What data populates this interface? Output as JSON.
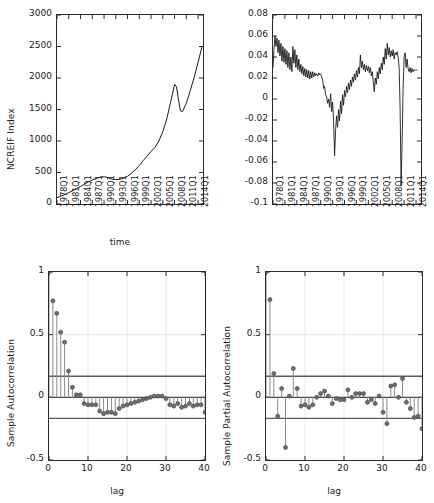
{
  "figure": {
    "width": 434,
    "height": 503,
    "background": "#ffffff",
    "line_color": "#1a1a1a",
    "axis_color": "#2b2b2b",
    "marker_color": "#6e6e6e",
    "bound_color": "#5a5a5a"
  },
  "chart_data": [
    {
      "id": "ncreif-index-series",
      "type": "line",
      "title": "",
      "xlabel": "time",
      "ylabel": "NCREIF Index",
      "ylim": [
        0,
        3000
      ],
      "yticks": [
        0,
        500,
        1000,
        1500,
        2000,
        2500,
        3000
      ],
      "ytick_labels": [
        "0",
        "500",
        "1000",
        "1500",
        "2000",
        "2500",
        "3000"
      ],
      "xlim": [
        1978,
        2015.25
      ],
      "xticks": [
        1978,
        1981,
        1984,
        1987,
        1990,
        1993,
        1996,
        1999,
        2002,
        2005,
        2008,
        2011,
        2014
      ],
      "xtick_labels": [
        "1978Q1",
        "1981Q1",
        "1984Q1",
        "1987Q1",
        "1990Q1",
        "1993Q1",
        "1996Q1",
        "1999Q1",
        "2002Q1",
        "2005Q1",
        "2008Q1",
        "2011Q1",
        "2014Q1"
      ],
      "grid": false,
      "x": [
        1978.0,
        1979.0,
        1980.0,
        1981.0,
        1982.0,
        1983.0,
        1984.0,
        1985.0,
        1986.0,
        1987.0,
        1988.0,
        1989.0,
        1990.0,
        1990.75,
        1991.5,
        1992.25,
        1993.0,
        1993.75,
        1994.5,
        1995.25,
        1996.0,
        1997.0,
        1998.0,
        1999.0,
        2000.0,
        2001.0,
        2002.0,
        2003.0,
        2004.0,
        2005.0,
        2006.0,
        2007.0,
        2008.0,
        2008.5,
        2009.0,
        2009.5,
        2010.0,
        2011.0,
        2012.0,
        2013.0,
        2014.0,
        2015.0
      ],
      "y": [
        100,
        125,
        150,
        180,
        210,
        245,
        280,
        315,
        350,
        380,
        405,
        425,
        432,
        425,
        405,
        392,
        388,
        392,
        400,
        415,
        440,
        490,
        545,
        610,
        690,
        760,
        835,
        900,
        1000,
        1150,
        1350,
        1620,
        1900,
        1860,
        1650,
        1480,
        1465,
        1600,
        1800,
        2010,
        2250,
        2500
      ]
    },
    {
      "id": "ncreif-returns-series",
      "type": "line",
      "title": "",
      "xlabel": "",
      "ylabel": "",
      "ylim": [
        -0.1,
        0.08
      ],
      "yticks": [
        -0.1,
        -0.08,
        -0.06,
        -0.04,
        -0.02,
        0,
        0.02,
        0.04,
        0.06,
        0.08
      ],
      "ytick_labels": [
        "-0.1",
        "-0.08",
        "-0.06",
        "-0.04",
        "-0.02",
        "0",
        "0.02",
        "0.04",
        "0.06",
        "0.08"
      ],
      "xlim": [
        1978,
        2015.25
      ],
      "xticks": [
        1978,
        1981,
        1984,
        1987,
        1990,
        1993,
        1996,
        1999,
        2002,
        2005,
        2008,
        2011,
        2014
      ],
      "xtick_labels": [
        "1978Q1",
        "1981Q1",
        "1984Q1",
        "1987Q1",
        "1990Q1",
        "1993Q1",
        "1996Q1",
        "1999Q1",
        "2002Q1",
        "2005Q1",
        "2008Q1",
        "2011Q1",
        "2014Q1"
      ],
      "grid": false,
      "x": [
        1978.0,
        1978.25,
        1978.5,
        1978.75,
        1979.0,
        1979.25,
        1979.5,
        1979.75,
        1980.0,
        1980.25,
        1980.5,
        1980.75,
        1981.0,
        1981.25,
        1981.5,
        1981.75,
        1982.0,
        1982.25,
        1982.5,
        1982.75,
        1983.0,
        1983.25,
        1983.5,
        1983.75,
        1984.0,
        1984.25,
        1984.5,
        1984.75,
        1985.0,
        1985.25,
        1985.5,
        1985.75,
        1986.0,
        1986.25,
        1986.5,
        1986.75,
        1987.0,
        1987.25,
        1987.5,
        1987.75,
        1988.0,
        1988.25,
        1988.5,
        1988.75,
        1989.0,
        1989.25,
        1989.5,
        1989.75,
        1990.0,
        1990.25,
        1990.5,
        1990.75,
        1991.0,
        1991.25,
        1991.5,
        1991.75,
        1992.0,
        1992.25,
        1992.5,
        1992.75,
        1993.0,
        1993.25,
        1993.5,
        1993.75,
        1994.0,
        1994.25,
        1994.5,
        1994.75,
        1995.0,
        1995.25,
        1995.5,
        1995.75,
        1996.0,
        1996.25,
        1996.5,
        1996.75,
        1997.0,
        1997.25,
        1997.5,
        1997.75,
        1998.0,
        1998.25,
        1998.5,
        1998.75,
        1999.0,
        1999.25,
        1999.5,
        1999.75,
        2000.0,
        2000.25,
        2000.5,
        2000.75,
        2001.0,
        2001.25,
        2001.5,
        2001.75,
        2002.0,
        2002.25,
        2002.5,
        2002.75,
        2003.0,
        2003.25,
        2003.5,
        2003.75,
        2004.0,
        2004.25,
        2004.5,
        2004.75,
        2005.0,
        2005.25,
        2005.5,
        2005.75,
        2006.0,
        2006.25,
        2006.5,
        2006.75,
        2007.0,
        2007.25,
        2007.5,
        2007.75,
        2008.0,
        2008.25,
        2008.5,
        2008.75,
        2009.0,
        2009.25,
        2009.5,
        2009.75,
        2010.0,
        2010.25,
        2010.5,
        2010.75,
        2011.0,
        2011.25,
        2011.5,
        2011.75,
        2012.0,
        2012.25,
        2012.5,
        2012.75,
        2013.0,
        2013.25,
        2013.5,
        2013.75,
        2014.0,
        2014.25,
        2014.5,
        2014.75,
        2015.0
      ],
      "y": [
        0.03,
        0.047,
        0.06,
        0.05,
        0.058,
        0.044,
        0.056,
        0.041,
        0.053,
        0.036,
        0.05,
        0.035,
        0.048,
        0.033,
        0.046,
        0.03,
        0.044,
        0.028,
        0.04,
        0.026,
        0.05,
        0.034,
        0.047,
        0.03,
        0.042,
        0.028,
        0.038,
        0.026,
        0.033,
        0.024,
        0.031,
        0.022,
        0.029,
        0.021,
        0.028,
        0.02,
        0.027,
        0.019,
        0.026,
        0.02,
        0.026,
        0.021,
        0.025,
        0.022,
        0.024,
        0.022,
        0.025,
        0.023,
        0.024,
        0.021,
        0.018,
        0.01,
        0.012,
        0.004,
        0.002,
        -0.004,
        0.0,
        -0.008,
        0.005,
        -0.012,
        -0.003,
        -0.02,
        -0.054,
        -0.03,
        -0.016,
        -0.027,
        -0.01,
        -0.021,
        -0.002,
        -0.014,
        0.004,
        -0.006,
        0.008,
        0.002,
        0.012,
        0.006,
        0.015,
        0.009,
        0.018,
        0.012,
        0.021,
        0.016,
        0.024,
        0.018,
        0.027,
        0.021,
        0.03,
        0.024,
        0.042,
        0.03,
        0.036,
        0.028,
        0.033,
        0.026,
        0.032,
        0.027,
        0.031,
        0.025,
        0.03,
        0.022,
        0.026,
        0.016,
        0.007,
        0.02,
        0.014,
        0.026,
        0.019,
        0.03,
        0.024,
        0.034,
        0.028,
        0.04,
        0.033,
        0.048,
        0.038,
        0.053,
        0.042,
        0.049,
        0.04,
        0.046,
        0.041,
        0.047,
        0.038,
        0.044,
        0.042,
        0.045,
        0.04,
        0.03,
        -0.01,
        -0.083,
        -0.04,
        0.01,
        0.04,
        0.044,
        0.03,
        0.038,
        0.029,
        0.026,
        0.03,
        0.025,
        0.029,
        0.026,
        0.028,
        0.027,
        0.028,
        0.027
      ]
    },
    {
      "id": "sample-autocorrelation",
      "type": "stem",
      "title": "",
      "xlabel": "lag",
      "ylabel": "Sample Autocorrelation",
      "ylim": [
        -0.5,
        1
      ],
      "yticks": [
        -0.5,
        0,
        0.5,
        1
      ],
      "ytick_labels": [
        "-0.5",
        "0",
        "0.5",
        "1"
      ],
      "xlim": [
        0,
        40
      ],
      "xticks": [
        0,
        10,
        20,
        30,
        40
      ],
      "xtick_labels": [
        "0",
        "10",
        "20",
        "30",
        "40"
      ],
      "grid": true,
      "confidence_bounds": [
        0.168,
        -0.168
      ],
      "lags": [
        0,
        1,
        2,
        3,
        4,
        5,
        6,
        7,
        8,
        9,
        10,
        11,
        12,
        13,
        14,
        15,
        16,
        17,
        18,
        19,
        20,
        21,
        22,
        23,
        24,
        25,
        26,
        27,
        28,
        29,
        30,
        31,
        32,
        33,
        34,
        35,
        36,
        37,
        38,
        39,
        40
      ],
      "values": [
        1.0,
        0.77,
        0.67,
        0.52,
        0.44,
        0.21,
        0.08,
        0.02,
        0.02,
        -0.05,
        -0.06,
        -0.06,
        -0.06,
        -0.11,
        -0.13,
        -0.12,
        -0.12,
        -0.13,
        -0.09,
        -0.07,
        -0.06,
        -0.05,
        -0.04,
        -0.03,
        -0.02,
        -0.01,
        0.0,
        0.01,
        0.01,
        0.01,
        -0.01,
        -0.06,
        -0.07,
        -0.05,
        -0.08,
        -0.07,
        -0.05,
        -0.07,
        -0.06,
        -0.06,
        -0.12
      ]
    },
    {
      "id": "sample-partial-autocorrelation",
      "type": "stem",
      "title": "",
      "xlabel": "lag",
      "ylabel": "Sample Partial Autocorrelation",
      "ylim": [
        -0.5,
        1
      ],
      "yticks": [
        -0.5,
        0,
        0.5,
        1
      ],
      "ytick_labels": [
        "-0.5",
        "0",
        "0.5",
        "1"
      ],
      "xlim": [
        0,
        40
      ],
      "xticks": [
        0,
        10,
        20,
        30,
        40
      ],
      "xtick_labels": [
        "0",
        "10",
        "20",
        "30",
        "40"
      ],
      "grid": true,
      "confidence_bounds": [
        0.168,
        -0.168
      ],
      "lags": [
        0,
        1,
        2,
        3,
        4,
        5,
        6,
        7,
        8,
        9,
        10,
        11,
        12,
        13,
        14,
        15,
        16,
        17,
        18,
        19,
        20,
        21,
        22,
        23,
        24,
        25,
        26,
        27,
        28,
        29,
        30,
        31,
        32,
        33,
        34,
        35,
        36,
        37,
        38,
        39,
        40
      ],
      "values": [
        1.0,
        0.78,
        0.19,
        -0.15,
        0.07,
        -0.4,
        0.01,
        0.23,
        0.07,
        -0.07,
        -0.06,
        -0.08,
        -0.06,
        0.0,
        0.03,
        0.05,
        0.01,
        -0.05,
        -0.01,
        -0.02,
        -0.02,
        0.06,
        0.0,
        0.03,
        0.03,
        0.03,
        -0.04,
        -0.02,
        -0.05,
        0.01,
        -0.12,
        -0.21,
        0.09,
        0.1,
        0.0,
        0.15,
        -0.04,
        -0.09,
        -0.16,
        -0.15,
        -0.25
      ]
    }
  ]
}
